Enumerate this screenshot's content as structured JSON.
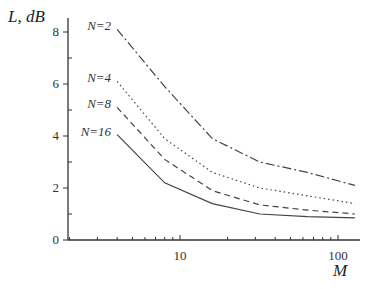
{
  "chart_data": {
    "type": "line",
    "title": "",
    "xlabel": "M",
    "ylabel": "L, dB",
    "xscale": "log",
    "xlim": [
      2,
      138
    ],
    "ylim": [
      0,
      8.5
    ],
    "xticks": [
      10,
      100
    ],
    "xtick_labels": [
      "10",
      "100"
    ],
    "yticks": [
      0,
      2,
      4,
      6,
      8
    ],
    "ytick_labels": [
      "0",
      "2",
      "4",
      "6",
      "8"
    ],
    "grid": false,
    "legend": "inline labels at left end of curves",
    "x": [
      4,
      8,
      16,
      32,
      64,
      128
    ],
    "series": [
      {
        "name": "N=2",
        "style": "dash-dot",
        "values": [
          8.1,
          5.9,
          3.9,
          3.0,
          2.6,
          2.1
        ]
      },
      {
        "name": "N=4",
        "style": "dotted",
        "values": [
          6.1,
          3.9,
          2.6,
          2.0,
          1.7,
          1.4
        ]
      },
      {
        "name": "N=8",
        "style": "dashed",
        "values": [
          5.1,
          3.1,
          1.9,
          1.35,
          1.15,
          1.0
        ]
      },
      {
        "name": "N=16",
        "style": "solid",
        "values": [
          4.05,
          2.2,
          1.4,
          1.0,
          0.9,
          0.85
        ]
      }
    ]
  }
}
